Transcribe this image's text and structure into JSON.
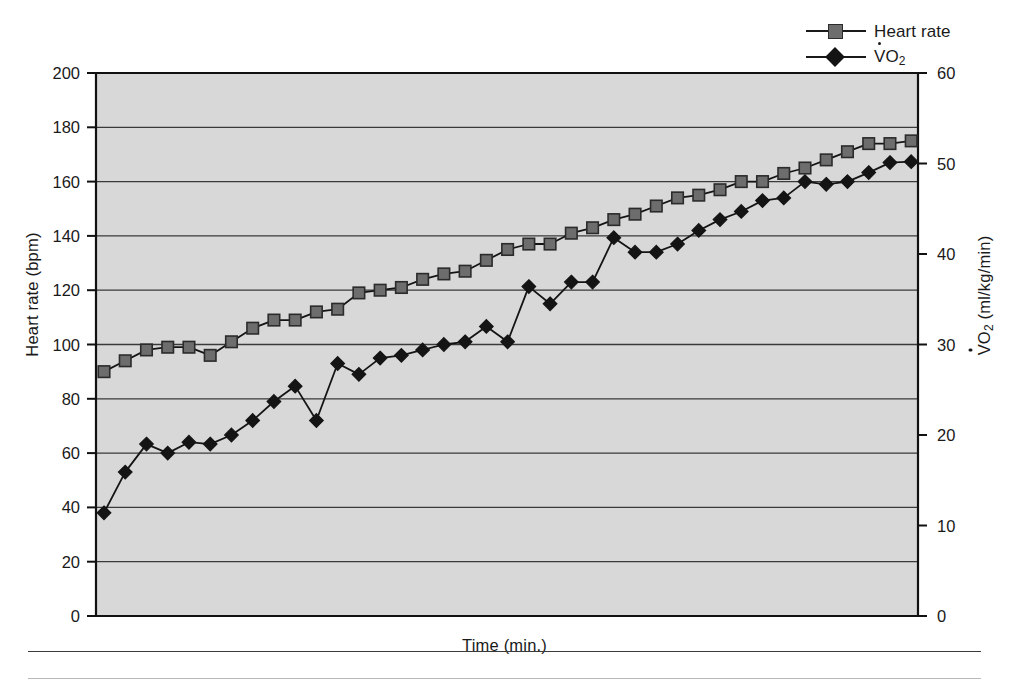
{
  "legend": {
    "position": "top-right",
    "entries": [
      {
        "label": "Heart rate",
        "marker": "square-marker-icon",
        "color": "#6d6d6d"
      },
      {
        "label": "VO2",
        "label_prefix": "V",
        "label_sub": "2",
        "marker": "diamond-marker-icon",
        "color": "#141414"
      }
    ]
  },
  "axes": {
    "left_title": "Heart rate (bpm)",
    "right_title_main": "O",
    "right_title_prefix": "V",
    "right_title_sub": "2",
    "right_title_units": " (ml/kg/min)",
    "x_title": "Time (min.)",
    "left_ticks": [
      "200",
      "180",
      "160",
      "140",
      "120",
      "100",
      "80",
      "60",
      "40",
      "20",
      "0"
    ],
    "right_ticks": [
      "60",
      "50",
      "40",
      "30",
      "20",
      "10",
      "0"
    ]
  },
  "chart_data": {
    "type": "line",
    "title": "",
    "xlabel": "Time (min.)",
    "ylabel": "Heart rate (bpm)",
    "y2label": "VO2 (ml/kg/min)",
    "ylim": [
      0,
      200
    ],
    "y2lim": [
      0,
      60
    ],
    "ytick_step": 20,
    "y2tick_step": 10,
    "grid": "horizontal",
    "xlim": [
      0,
      38
    ],
    "xticks_shown": false,
    "x": [
      0,
      1,
      2,
      3,
      4,
      5,
      6,
      7,
      8,
      9,
      10,
      11,
      12,
      13,
      14,
      15,
      16,
      17,
      18,
      19,
      20,
      21,
      22,
      23,
      24,
      25,
      26,
      27,
      28,
      29,
      30,
      31,
      32,
      33,
      34,
      35,
      36,
      37,
      38
    ],
    "series": [
      {
        "name": "Heart rate",
        "unit": "bpm",
        "axis": "left",
        "marker": "square",
        "color": "#6d6d6d",
        "values": [
          90,
          94,
          98,
          99,
          99,
          96,
          101,
          106,
          109,
          109,
          112,
          113,
          119,
          120,
          121,
          124,
          126,
          127,
          131,
          135,
          137,
          137,
          141,
          143,
          146,
          148,
          151,
          154,
          155,
          157,
          160,
          160,
          163,
          165,
          168,
          171,
          174,
          174,
          175
        ]
      },
      {
        "name": "VO2",
        "unit": "ml/kg/min",
        "axis": "right",
        "marker": "diamond",
        "color": "#141414",
        "values": [
          11.4,
          15.9,
          19.0,
          18.0,
          19.2,
          19.0,
          20.0,
          21.6,
          23.7,
          25.4,
          21.6,
          27.9,
          26.7,
          28.5,
          28.8,
          29.4,
          30.0,
          30.3,
          32.0,
          30.3,
          36.4,
          34.5,
          36.9,
          36.9,
          41.8,
          40.2,
          40.2,
          41.1,
          42.6,
          43.8,
          44.7,
          45.9,
          46.2,
          48.0,
          47.7,
          48.0,
          49.0,
          50.1,
          50.2
        ]
      }
    ]
  },
  "colors": {
    "plot_background": "#d8d8d8",
    "grid_line": "#3a3a3a",
    "axis_line": "#111111",
    "heart_rate_marker": "#6d6d6d",
    "vo2_marker": "#141414",
    "text": "#1a1a1a"
  }
}
